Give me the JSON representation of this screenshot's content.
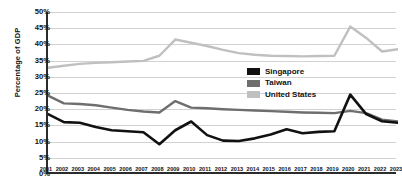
{
  "chart": {
    "type": "line",
    "ylabel": "Percentage of GDP",
    "y_ticks": [
      "50%",
      "45%",
      "40%",
      "35%",
      "30%",
      "25%",
      "20%",
      "15%",
      "10%",
      "5%",
      "0%"
    ]
  },
  "legend": {
    "position": "inside-right",
    "items": [
      {
        "label": "Singapore",
        "color": "#111111"
      },
      {
        "label": "Taiwan",
        "color": "#6e6e6e"
      },
      {
        "label": "United States",
        "color": "#c0c0c0"
      }
    ]
  },
  "chart_data": {
    "type": "line",
    "title": "",
    "xlabel": "",
    "ylabel": "Percentage of GDP",
    "ylim": [
      0,
      50
    ],
    "xlim": [
      2001,
      2023
    ],
    "grid": true,
    "legend_position": "inside-right",
    "x": [
      "2001",
      "2002",
      "2003",
      "2004",
      "2005",
      "2006",
      "2007",
      "2008",
      "2009",
      "2010",
      "2011",
      "2012",
      "2013",
      "2014",
      "2015",
      "2016",
      "2017",
      "2018",
      "2019",
      "2020",
      "2021",
      "2022",
      "2023"
    ],
    "series": [
      {
        "name": "Singapore",
        "color": "#111111",
        "values": [
          18.5,
          16.0,
          15.8,
          14.5,
          13.5,
          13.2,
          12.9,
          9.2,
          13.5,
          16.2,
          12.0,
          10.3,
          10.2,
          11.0,
          12.2,
          13.8,
          12.6,
          13.0,
          13.2,
          24.5,
          18.5,
          16.3,
          15.8
        ]
      },
      {
        "name": "Taiwan",
        "color": "#6e6e6e",
        "values": [
          24.2,
          21.8,
          21.6,
          21.2,
          20.5,
          19.8,
          19.3,
          19.0,
          22.5,
          20.5,
          20.3,
          20.0,
          19.8,
          19.6,
          19.4,
          19.2,
          19.0,
          18.9,
          18.8,
          19.5,
          18.8,
          16.8,
          16.2
        ]
      },
      {
        "name": "United States",
        "color": "#c0c0c0",
        "values": [
          32.8,
          33.4,
          34.0,
          34.3,
          34.5,
          34.7,
          34.9,
          36.5,
          41.5,
          40.5,
          39.5,
          38.3,
          37.3,
          36.8,
          36.5,
          36.4,
          36.3,
          36.4,
          36.5,
          45.5,
          42.0,
          37.8,
          38.5
        ]
      }
    ]
  }
}
